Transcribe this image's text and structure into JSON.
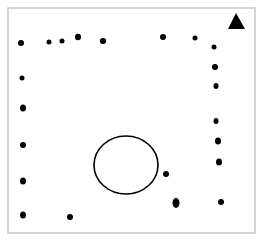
{
  "diagram": {
    "frame": {
      "x": 8,
      "y": 8,
      "width": 247,
      "height": 225,
      "stroke": "#c8c8c8"
    },
    "triangle": {
      "points": "236,13 228,29 245,29",
      "fill": "#000000"
    },
    "circle": {
      "cx": 126,
      "cy": 165,
      "rx": 32,
      "ry": 29,
      "stroke": "#000000"
    },
    "dots": [
      {
        "cx": 21,
        "cy": 43,
        "rx": 3,
        "ry": 3
      },
      {
        "cx": 49,
        "cy": 42,
        "rx": 2.5,
        "ry": 2.5
      },
      {
        "cx": 62,
        "cy": 41,
        "rx": 2.5,
        "ry": 2.5
      },
      {
        "cx": 78,
        "cy": 37,
        "rx": 3,
        "ry": 3.2
      },
      {
        "cx": 103,
        "cy": 41,
        "rx": 3.2,
        "ry": 3
      },
      {
        "cx": 163,
        "cy": 37,
        "rx": 3,
        "ry": 3
      },
      {
        "cx": 195,
        "cy": 38,
        "rx": 2.5,
        "ry": 2.5
      },
      {
        "cx": 214,
        "cy": 47,
        "rx": 2.5,
        "ry": 2.5
      },
      {
        "cx": 215,
        "cy": 67,
        "rx": 3,
        "ry": 3
      },
      {
        "cx": 216,
        "cy": 86,
        "rx": 2.5,
        "ry": 3
      },
      {
        "cx": 216,
        "cy": 121,
        "rx": 2.5,
        "ry": 3
      },
      {
        "cx": 218,
        "cy": 141,
        "rx": 3,
        "ry": 3.5
      },
      {
        "cx": 219,
        "cy": 162,
        "rx": 3,
        "ry": 3.5
      },
      {
        "cx": 221,
        "cy": 202,
        "rx": 3,
        "ry": 3
      },
      {
        "cx": 22,
        "cy": 78,
        "rx": 2.5,
        "ry": 2.5
      },
      {
        "cx": 23,
        "cy": 108,
        "rx": 3,
        "ry": 3.5
      },
      {
        "cx": 23,
        "cy": 145,
        "rx": 3,
        "ry": 3
      },
      {
        "cx": 23,
        "cy": 181,
        "rx": 3,
        "ry": 3.5
      },
      {
        "cx": 23,
        "cy": 215,
        "rx": 3,
        "ry": 3.5
      },
      {
        "cx": 70,
        "cy": 217,
        "rx": 3,
        "ry": 3
      },
      {
        "cx": 166,
        "cy": 174,
        "rx": 3,
        "ry": 3
      },
      {
        "cx": 176,
        "cy": 203,
        "rx": 3.5,
        "ry": 5
      }
    ]
  }
}
